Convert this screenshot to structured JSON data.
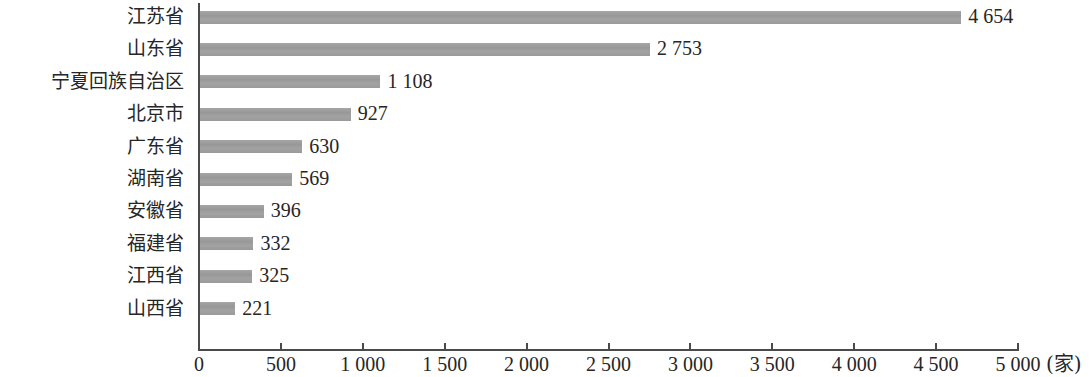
{
  "chart_data": {
    "type": "bar",
    "orientation": "horizontal",
    "title": "",
    "subtitle": "",
    "xlabel": "",
    "ylabel": "",
    "unit_label": "(家)",
    "xlim": [
      0,
      5000
    ],
    "grid": false,
    "legend": null,
    "bar_color": "#9e9e9e",
    "axis_color": "#4a4a4a",
    "background": "#ffffff",
    "categories": [
      "江苏省",
      "山东省",
      "宁夏回族自治区",
      "北京市",
      "广东省",
      "湖南省",
      "安徽省",
      "福建省",
      "江西省",
      "山西省"
    ],
    "values": [
      4654,
      2753,
      1108,
      927,
      630,
      569,
      396,
      332,
      325,
      221
    ],
    "value_labels": [
      "4 654",
      "2 753",
      "1 108",
      "927",
      "630",
      "569",
      "396",
      "332",
      "325",
      "221"
    ],
    "xticks": [
      0,
      500,
      1000,
      1500,
      2000,
      2500,
      3000,
      3500,
      4000,
      4500,
      5000
    ],
    "xtick_labels": [
      "0",
      "500",
      "1 000",
      "1 500",
      "2 000",
      "2 500",
      "3 000",
      "3 500",
      "4 000",
      "4 500",
      "5 000"
    ]
  }
}
